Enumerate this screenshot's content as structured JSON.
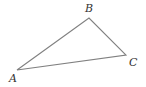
{
  "diagram": {
    "type": "triangle",
    "stroke_color": "#808080",
    "label_color": "#333333",
    "vertices": [
      {
        "label": "A",
        "x": 17,
        "y": 70,
        "lx": 9,
        "ly": 82
      },
      {
        "label": "B",
        "x": 89,
        "y": 18,
        "lx": 85,
        "ly": 12
      },
      {
        "label": "C",
        "x": 126,
        "y": 55,
        "lx": 129,
        "ly": 66
      }
    ]
  }
}
